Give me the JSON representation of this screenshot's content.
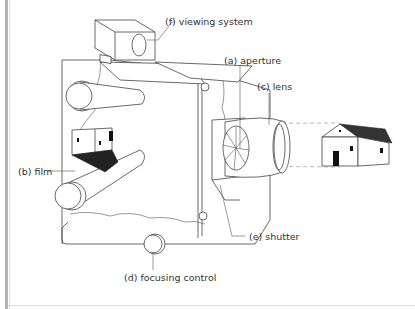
{
  "diagram": {
    "labels": {
      "viewing_system": "(f) viewing system",
      "aperture": "(a) aperture",
      "lens": "(c) lens",
      "film": "(b) film",
      "shutter": "(e) shutter",
      "focusing_control": "(d) focusing control"
    }
  },
  "colors": {
    "line": "#444444",
    "label_text": "#333333",
    "light_ray": "#999999",
    "left_bar": "#b5b5b5"
  }
}
